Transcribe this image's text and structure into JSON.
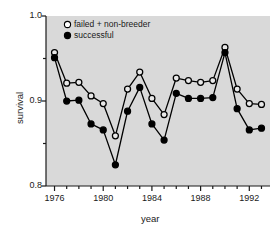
{
  "chart_data": {
    "type": "line",
    "title": "",
    "xlabel": "year",
    "ylabel": "survival",
    "xlim": [
      1975.3,
      1993.7
    ],
    "ylim": [
      0.8,
      1.0
    ],
    "grid": false,
    "legend_position": "top-left-inside",
    "x_tick_labels": [
      "1976",
      "1980",
      "1984",
      "1988",
      "1992"
    ],
    "x_major_ticks": [
      1976,
      1980,
      1984,
      1988,
      1992
    ],
    "x_minor_ticks": [
      1977,
      1978,
      1979,
      1981,
      1982,
      1983,
      1985,
      1986,
      1987,
      1989,
      1990,
      1991,
      1993
    ],
    "y_tick_labels": [
      "1.0",
      "0.9",
      "0.8"
    ],
    "y_major_ticks": [
      1.0,
      0.9,
      0.8
    ],
    "y_minor_ticks": [
      0.95,
      0.85
    ],
    "x": [
      1976,
      1977,
      1978,
      1979,
      1980,
      1981,
      1982,
      1983,
      1984,
      1985,
      1986,
      1987,
      1988,
      1989,
      1990,
      1991,
      1992,
      1993
    ],
    "series": [
      {
        "name": "failed + non-breeder",
        "marker": "open-circle",
        "color": "#000000",
        "values": [
          0.957,
          0.921,
          0.922,
          0.906,
          0.897,
          0.859,
          0.914,
          0.934,
          0.903,
          0.884,
          0.927,
          0.924,
          0.922,
          0.924,
          0.963,
          0.914,
          0.897,
          0.896
        ]
      },
      {
        "name": "successful",
        "marker": "filled-circle",
        "color": "#000000",
        "values": [
          0.951,
          0.9,
          0.901,
          0.873,
          0.866,
          0.825,
          0.888,
          0.916,
          0.873,
          0.854,
          0.909,
          0.903,
          0.903,
          0.904,
          0.957,
          0.891,
          0.866,
          0.868
        ]
      }
    ]
  },
  "axis": {
    "y_title": "survival",
    "x_title": "year"
  },
  "legend": {
    "items": [
      {
        "label": "failed + non-breeder",
        "marker": "open-circle"
      },
      {
        "label": "successful",
        "marker": "filled-circle"
      }
    ]
  }
}
